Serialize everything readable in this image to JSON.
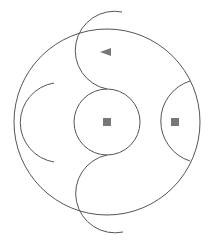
{
  "diagram": {
    "width": 208,
    "height": 245,
    "colors": {
      "background": "#ffffff",
      "stroke": "#555555",
      "marker": "#777777"
    },
    "outer_circle": {
      "cx": 107,
      "cy": 122,
      "r": 93
    },
    "center_circle": {
      "cx": 107,
      "cy": 122,
      "r": 33
    },
    "arcs": {
      "top_s_curve": "M 122 12 A 34 34 0 0 0 107 89",
      "bottom_s_curve": "M 107 155 A 34 34 0 0 0 123 232",
      "right_arc": "M 190 81 A 42 42 0 0 0 190 161",
      "left_arc": "M 54 83 A 40 40 0 0 0 54 162"
    },
    "markers": [
      {
        "type": "triangle-left",
        "points": "100,52 111,48 111,56"
      },
      {
        "type": "square",
        "x": 103,
        "y": 118,
        "size": 8
      },
      {
        "type": "square",
        "x": 171,
        "y": 118,
        "size": 8
      }
    ]
  }
}
